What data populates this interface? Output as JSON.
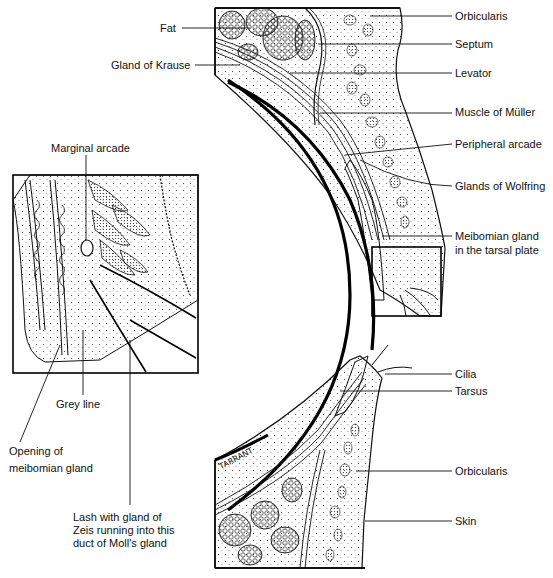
{
  "diagram": {
    "type": "anatomical-illustration",
    "signature": "TARRANT",
    "upper_lid_labels": [
      {
        "id": "fat",
        "text": "Fat"
      },
      {
        "id": "gland_of_krause",
        "text": "Gland of Krause"
      },
      {
        "id": "orbicularis_upper",
        "text": "Orbicularis"
      },
      {
        "id": "septum",
        "text": "Septum"
      },
      {
        "id": "levator",
        "text": "Levator"
      },
      {
        "id": "muscle_of_muller",
        "text": "Muscle of Müller"
      },
      {
        "id": "peripheral_arcade",
        "text": "Peripheral arcade"
      },
      {
        "id": "glands_of_wolfring",
        "text": "Glands of Wolfring"
      },
      {
        "id": "meibomian_gland",
        "text": "Meibomian gland in the tarsal plate",
        "lines": [
          "Meibomian gland",
          "in the tarsal plate"
        ]
      }
    ],
    "inset_labels": [
      {
        "id": "marginal_arcade",
        "text": "Marginal arcade"
      },
      {
        "id": "grey_line",
        "text": "Grey line"
      },
      {
        "id": "opening_meibomian",
        "text": "Opening of meibomian gland",
        "lines": [
          "Opening of",
          "meibomian gland"
        ]
      },
      {
        "id": "lash_zeis",
        "text": "Lash with gland of Zeis running into this duct of Moll's gland",
        "lines": [
          "Lash with gland of",
          "Zeis running into this",
          "duct of Moll's gland"
        ]
      }
    ],
    "lower_lid_labels": [
      {
        "id": "cilia",
        "text": "Cilia"
      },
      {
        "id": "tarsus",
        "text": "Tarsus"
      },
      {
        "id": "orbicularis_lower",
        "text": "Orbicularis"
      },
      {
        "id": "skin",
        "text": "Skin"
      }
    ]
  },
  "labels": {
    "fat": "Fat",
    "gland_of_krause": "Gland of Krause",
    "orbicularis_upper": "Orbicularis",
    "septum": "Septum",
    "levator": "Levator",
    "muscle_of_muller": "Muscle of Müller",
    "peripheral_arcade": "Peripheral arcade",
    "glands_of_wolfring": "Glands of Wolfring",
    "meibomian_l1": "Meibomian gland",
    "meibomian_l2": "in the tarsal plate",
    "marginal_arcade": "Marginal arcade",
    "grey_line": "Grey line",
    "opening_l1": "Opening of",
    "opening_l2": "meibomian gland",
    "lash_l1": "Lash with gland of",
    "lash_l2": "Zeis running into this",
    "lash_l3": "duct of Moll's gland",
    "cilia": "Cilia",
    "tarsus": "Tarsus",
    "orbicularis_lower": "Orbicularis",
    "skin": "Skin",
    "signature": "TARRANT"
  }
}
